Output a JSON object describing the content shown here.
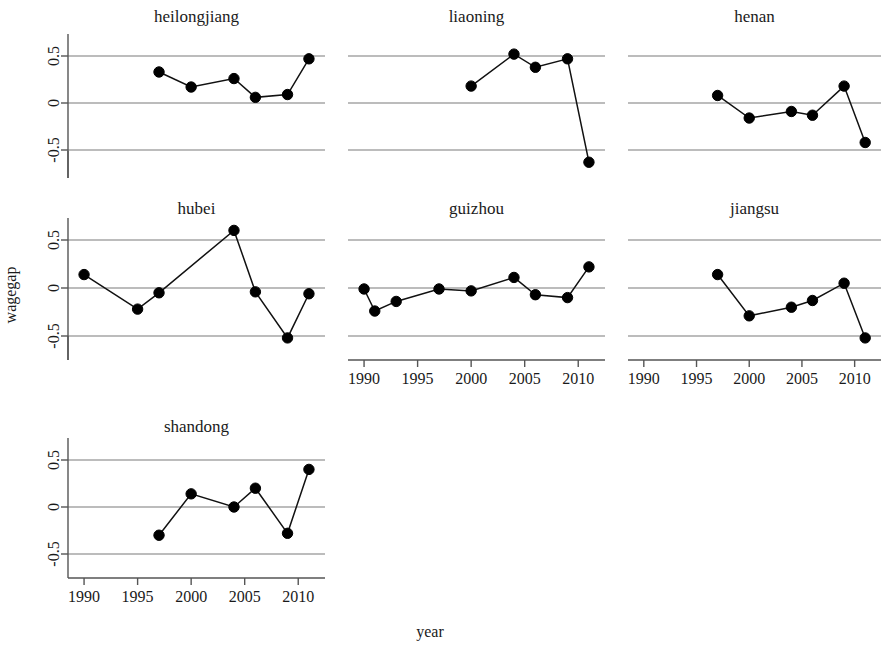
{
  "figure": {
    "xlabel": "year",
    "ylabel": "wagegap"
  },
  "chart_data": {
    "type": "line",
    "title": "",
    "xlabel": "year",
    "ylabel": "wagegap",
    "xlim": [
      1988.5,
      2012.5
    ],
    "ylim": [
      -0.8,
      0.78
    ],
    "yticks": [
      0.5,
      0,
      -0.5
    ],
    "ytick_labels": [
      "0.5",
      "0",
      "-0.5"
    ],
    "xticks": [
      1990,
      1995,
      2000,
      2005,
      2010
    ],
    "xtick_labels": [
      "1990",
      "1995",
      "2000",
      "2005",
      "2010"
    ],
    "grid": true,
    "legend": "none",
    "layout": "small-multiples 3x3 (7 panels used)",
    "marker": "filled circle",
    "panels": [
      {
        "name": "heilongjiang",
        "row": 0,
        "col": 0,
        "x": [
          1997,
          2000,
          2004,
          2006,
          2009,
          2011
        ],
        "y": [
          0.33,
          0.17,
          0.26,
          0.06,
          0.09,
          0.47
        ]
      },
      {
        "name": "liaoning",
        "row": 0,
        "col": 1,
        "x": [
          2000,
          2004,
          2006,
          2009,
          2011
        ],
        "y": [
          0.18,
          0.52,
          0.38,
          0.47,
          -0.63
        ]
      },
      {
        "name": "henan",
        "row": 0,
        "col": 2,
        "x": [
          1997,
          2000,
          2004,
          2006,
          2009,
          2011
        ],
        "y": [
          0.08,
          -0.16,
          -0.09,
          -0.13,
          0.18,
          -0.42
        ]
      },
      {
        "name": "hubei",
        "row": 1,
        "col": 0,
        "x": [
          1990,
          1995,
          1997,
          2004,
          2006,
          2009,
          2011
        ],
        "y": [
          0.14,
          -0.22,
          -0.05,
          0.6,
          -0.04,
          -0.52,
          -0.06
        ]
      },
      {
        "name": "guizhou",
        "row": 1,
        "col": 1,
        "x": [
          1990,
          1991,
          1993,
          1997,
          2000,
          2004,
          2006,
          2009,
          2011
        ],
        "y": [
          -0.01,
          -0.24,
          -0.14,
          -0.01,
          -0.03,
          0.11,
          -0.07,
          -0.1,
          0.22
        ]
      },
      {
        "name": "jiangsu",
        "row": 1,
        "col": 2,
        "x": [
          1997,
          2000,
          2004,
          2006,
          2009,
          2011
        ],
        "y": [
          0.14,
          -0.29,
          -0.2,
          -0.13,
          0.05,
          -0.52
        ]
      },
      {
        "name": "shandong",
        "row": 2,
        "col": 0,
        "x": [
          1997,
          2000,
          2004,
          2006,
          2009,
          2011
        ],
        "y": [
          -0.3,
          0.14,
          0.0,
          0.2,
          -0.28,
          0.4
        ]
      }
    ]
  }
}
